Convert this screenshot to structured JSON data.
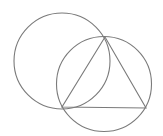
{
  "diagram": {
    "background": "#ffffff",
    "stroke_color": "#7a7a7a",
    "circles": [
      {
        "name": "left-circle",
        "cx": 62,
        "cy": 61,
        "r": 48
      },
      {
        "name": "right-circle",
        "cx": 104,
        "cy": 84,
        "r": 47.5
      }
    ],
    "triangle": {
      "name": "inscribed-triangle",
      "vertices": [
        [
          105,
          37
        ],
        [
          62,
          107
        ],
        [
          146,
          108
        ]
      ]
    }
  }
}
